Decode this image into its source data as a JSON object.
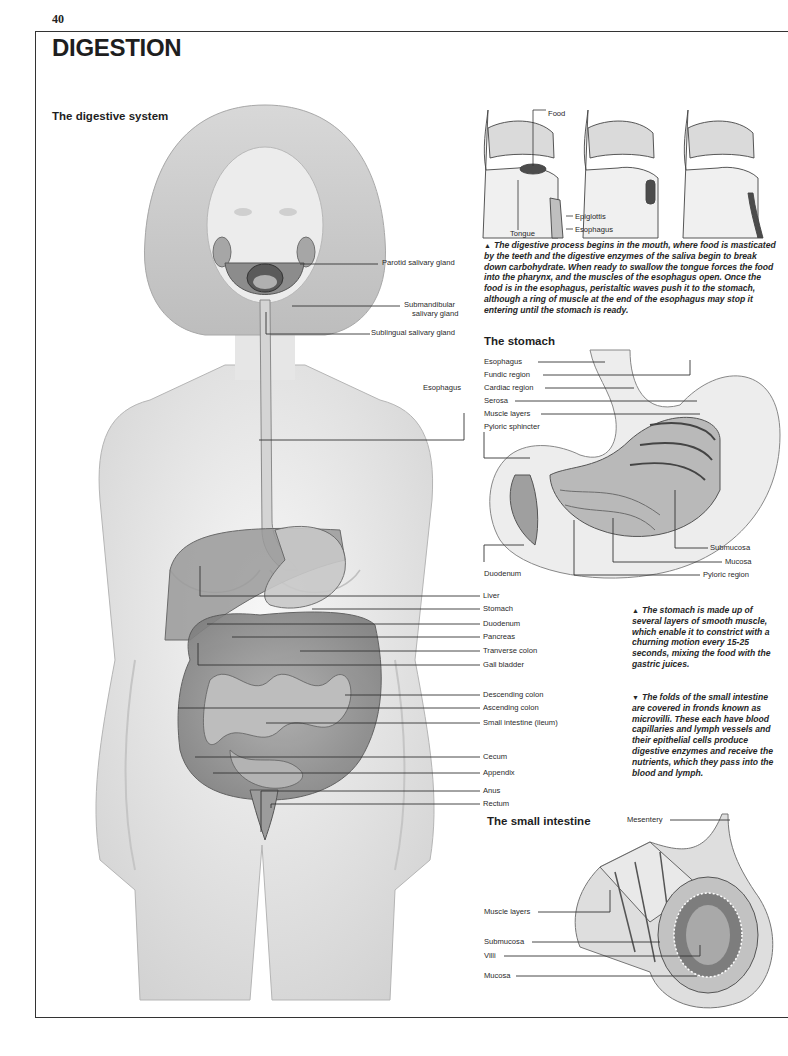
{
  "page": {
    "number": "40",
    "title": "DIGESTION"
  },
  "digestive_system": {
    "title": "The digestive system",
    "head_labels": [
      "Parotid salivary gland",
      "Submandibular",
      "salivary gland",
      "Sublingual salivary gland",
      "Esophagus"
    ],
    "abdomen_labels": [
      "Liver",
      "Stomach",
      "Duodenum",
      "Pancreas",
      "Tranverse colon",
      "Gall bladder",
      "Descending colon",
      "Ascending colon",
      "Small intestine (ileum)",
      "Cecum",
      "Appendix",
      "Anus",
      "Rectum"
    ]
  },
  "swallowing": {
    "labels": {
      "food": "Food",
      "tongue": "Tongue",
      "epiglottis": "Epiglottis",
      "esophagus": "Esophagus"
    },
    "caption_marker": "▲",
    "caption": "The digestive process begins in the mouth, where food is masticated by the teeth and the digestive enzymes of the saliva begin to break down carbohydrate. When ready to swallow the tongue forces the food into the pharynx, and the muscles of the esophagus open. Once the food is in the esophagus, peristaltic waves push it to the stomach, although a ring of muscle at the end of the esophagus may stop it entering until the stomach is ready."
  },
  "stomach": {
    "title": "The stomach",
    "left_labels": [
      "Esophagus",
      "Fundic region",
      "Cardiac region",
      "Serosa",
      "Muscle layers",
      "Pyloric sphincter"
    ],
    "bottom_labels": {
      "duodenum": "Duodenum",
      "submucosa": "Submucosa",
      "mucosa": "Mucosa",
      "pyloric_region": "Pyloric region"
    },
    "caption_marker": "▲",
    "caption": "The stomach is made up of several layers of smooth muscle, which enable it to constrict with a churning motion every 15-25 seconds, mixing the food with the gastric juices."
  },
  "small_intestine": {
    "title": "The small intestine",
    "labels": {
      "mesentery": "Mesentery",
      "muscle_layers": "Muscle layers",
      "submucosa": "Submucosa",
      "villi": "Villi",
      "mucosa": "Mucosa"
    },
    "caption_marker": "▼",
    "caption": "The folds of the small intestine are covered in fronds known as microvilli. These each have blood capillaries and lymph vessels and their epithelial cells produce digestive enzymes and receive the nutrients, which they pass into the blood and lymph."
  }
}
